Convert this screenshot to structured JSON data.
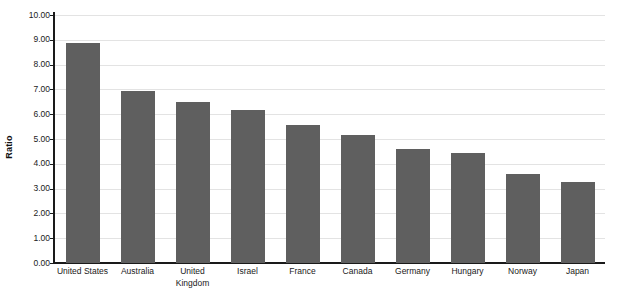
{
  "chart_data": {
    "type": "bar",
    "title": "",
    "xlabel": "",
    "ylabel": "Ratio",
    "ylim": [
      0,
      10
    ],
    "ytick_step": 1,
    "grid": true,
    "legend": false,
    "orientation": "vertical",
    "bar_color": "#5f5f5f",
    "gridline_color": "#e3e3e3",
    "axis_color": "#1a1a1a",
    "background_color": "#ffffff",
    "categories": [
      "United States",
      "Australia",
      "United Kingdom",
      "Israel",
      "France",
      "Canada",
      "Germany",
      "Hungary",
      "Norway",
      "Japan"
    ],
    "values": [
      8.87,
      6.95,
      6.48,
      6.15,
      5.55,
      5.18,
      4.6,
      4.42,
      3.58,
      3.25
    ],
    "ytick_labels": [
      "10.00",
      "9.00",
      "8.00",
      "7.00",
      "6.00",
      "5.00",
      "4.00",
      "3.00",
      "2.00",
      "1.00",
      "0.00"
    ],
    "ytick_values": [
      10,
      9,
      8,
      7,
      6,
      5,
      4,
      3,
      2,
      1,
      0
    ]
  }
}
